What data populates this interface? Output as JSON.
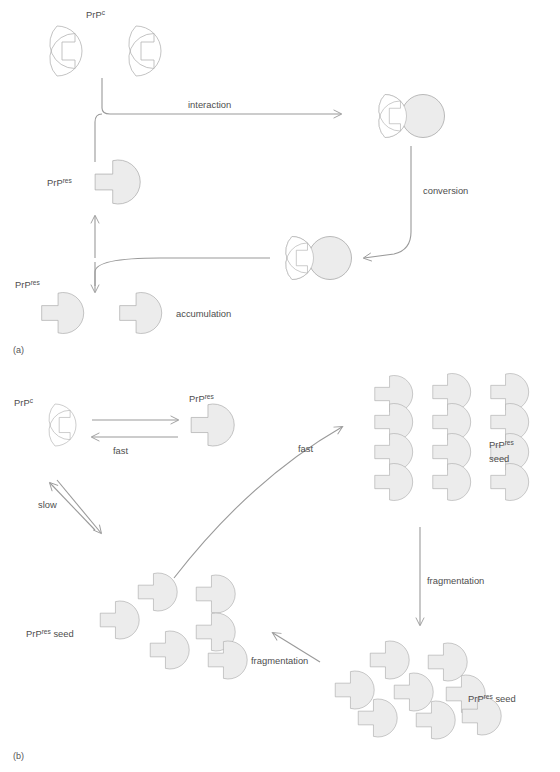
{
  "figure": {
    "panels": [
      {
        "id": "a",
        "label": "(a)",
        "caption": "template-directed conversion / heterodimer model"
      },
      {
        "id": "b",
        "label": "(b)",
        "caption": "nucleated polymerisation / seeding model"
      }
    ]
  },
  "species": {
    "prp_c": {
      "base": "PrP",
      "sup": "c",
      "style": "open-circle-with-notch",
      "fill": "#ffffff",
      "stroke": "#b4b4b4"
    },
    "prp_res": {
      "base": "PrP",
      "sup": "res",
      "style": "filled-circle-with-tab",
      "fill": "#ececec",
      "stroke": "#a8a8a8"
    }
  },
  "panel_a": {
    "label": "(a)",
    "labels": {
      "prp_c": {
        "base": "PrP",
        "sup": "c"
      },
      "prp_res_converted": {
        "base": "PrP",
        "sup": "res"
      },
      "prp_res_accumulated": {
        "base": "PrP",
        "sup": "res"
      }
    },
    "arrows": [
      {
        "name": "interaction",
        "label": "interaction",
        "direction": "right"
      },
      {
        "name": "conversion",
        "label": "conversion",
        "direction": "down-left"
      },
      {
        "name": "accumulation",
        "label": "accumulation",
        "direction": "left-up-down"
      }
    ],
    "shapes": {
      "free_prp_c_count": 2,
      "heterodimer": {
        "left": "PrPc",
        "right": "PrPres",
        "note": "PrPc docked onto PrPres"
      },
      "homodimer": {
        "left": "PrPres",
        "right": "PrPres",
        "note": "both converted"
      },
      "accumulated_count": 2
    }
  },
  "panel_b": {
    "label": "(b)",
    "labels": {
      "prp_c": {
        "base": "PrP",
        "sup": "c"
      },
      "prp_res_monomer": {
        "base": "PrP",
        "sup": "res"
      },
      "seed_ordered": {
        "base": "PrP",
        "sup": "res",
        "tail": " seed",
        "lines": [
          "PrPres",
          "seed"
        ]
      },
      "seed_left_cluster": {
        "base": "PrP",
        "sup": "res",
        "tail": " seed"
      },
      "seed_bottom_cluster": {
        "base": "PrP",
        "sup": "res",
        "tail": " seed"
      }
    },
    "arrows": [
      {
        "name": "fast-forward",
        "label": "fast",
        "direction": "right",
        "note": "PrPc to PrPres"
      },
      {
        "name": "fast-reverse",
        "label": "",
        "direction": "left",
        "note": "PrPres back to PrPc"
      },
      {
        "name": "slow",
        "label": "slow",
        "direction": "bidirectional-diagonal"
      },
      {
        "name": "fast-seeding",
        "label": "fast",
        "direction": "curved-up-right"
      },
      {
        "name": "fragmentation-vertical",
        "label": "fragmentation",
        "direction": "down"
      },
      {
        "name": "fragmentation-diagonal",
        "label": "fragmentation",
        "direction": "up-left"
      }
    ],
    "aggregates": {
      "ordered_seed": {
        "rows": 4,
        "cols": 3,
        "arrangement": "regular lattice"
      },
      "left_cluster": {
        "units": 6,
        "arrangement": "disordered"
      },
      "bottom_cluster": {
        "units": 9,
        "arrangement": "disordered"
      }
    }
  },
  "colors": {
    "prp_res_fill": "#ececec",
    "prp_res_stroke": "#a8a8a8",
    "prp_c_fill": "#ffffff",
    "prp_c_stroke": "#b4b4b4",
    "arrow": "#9a9a9a",
    "text": "#4e4e4e",
    "background": "#ffffff"
  }
}
